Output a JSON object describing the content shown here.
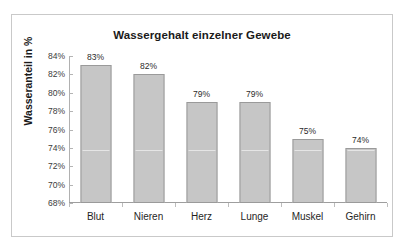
{
  "chart_data": {
    "type": "bar",
    "title": "Wassergehalt einzelner Gewebe",
    "xlabel": "",
    "ylabel": "Wasseranteil in %",
    "categories": [
      "Blut",
      "Nieren",
      "Herz",
      "Lunge",
      "Muskel",
      "Gehirn"
    ],
    "values": [
      83,
      82,
      79,
      79,
      75,
      74
    ],
    "data_labels": [
      "83%",
      "82%",
      "79%",
      "79%",
      "75%",
      "74%"
    ],
    "ylim": [
      68,
      84
    ],
    "ytick_step": 2,
    "ytick_labels": [
      "84%",
      "82%",
      "80%",
      "78%",
      "76%",
      "74%",
      "72%",
      "70%",
      "68%"
    ],
    "ytick_values": [
      84,
      82,
      80,
      78,
      76,
      74,
      72,
      70,
      68
    ],
    "grid": false,
    "legend": false,
    "bar_color": "#c6c6c6",
    "bar_border_color": "#9a9a9a",
    "frame_color": "#c9c9c9",
    "axis_color": "#9e9e9e",
    "text_color": "#1a1a1a",
    "background": "#ffffff"
  }
}
